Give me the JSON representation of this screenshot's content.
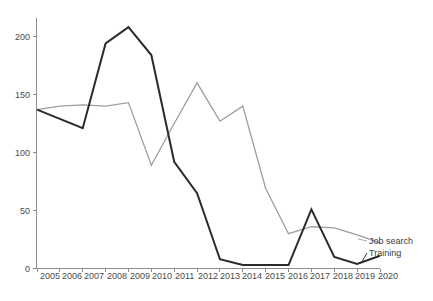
{
  "chart_data": {
    "type": "line",
    "title": "",
    "subtitle": "",
    "xlabel": "",
    "ylabel": "",
    "x": [
      2005,
      2006,
      2007,
      2008,
      2009,
      2010,
      2011,
      2012,
      2013,
      2014,
      2015,
      2016,
      2017,
      2018,
      2019,
      2020
    ],
    "categories": [
      "2005",
      "2006",
      "2007",
      "2008",
      "2009",
      "2010",
      "2011",
      "2012",
      "2013",
      "2014",
      "2015",
      "2016",
      "2017",
      "2018",
      "2019",
      "2020"
    ],
    "xtick_labels": [
      "2005",
      "2006",
      "2007",
      "2008",
      "2009",
      "2010",
      "2011",
      "2012",
      "2013",
      "2014",
      "2015",
      "2016",
      "2017",
      "2018",
      "2019",
      "2020"
    ],
    "ytick_labels": [
      "0",
      "50",
      "100",
      "150",
      "200"
    ],
    "yticks": [
      0,
      50,
      100,
      150,
      200
    ],
    "ylim": [
      0,
      215
    ],
    "xlim": [
      2005,
      2020
    ],
    "grid": false,
    "legend_position": "right-inline",
    "series": [
      {
        "name": "Job search",
        "color": "#9e9e9e",
        "label": "Job search",
        "values": [
          137,
          140,
          141,
          140,
          143,
          89,
          125,
          160,
          127,
          140,
          69,
          30,
          36,
          35,
          29,
          22
        ]
      },
      {
        "name": "Training",
        "color": "#2b2b2b",
        "label": "Training",
        "values": [
          137,
          129,
          121,
          194,
          208,
          184,
          92,
          65,
          8,
          3,
          3,
          3,
          51,
          10,
          4,
          11
        ]
      }
    ],
    "legend_entries": [
      {
        "label": "Job search",
        "color": "#9e9e9e"
      },
      {
        "label": "Training",
        "color": "#2b2b2b"
      }
    ]
  },
  "legend": {
    "job_search_label": "Job search",
    "training_label": "Training"
  },
  "axes": {
    "y_tick_0": "0",
    "y_tick_50": "50",
    "y_tick_100": "100",
    "y_tick_150": "150",
    "y_tick_200": "200",
    "x_tick_2005": "2005",
    "x_tick_2006": "2006",
    "x_tick_2007": "2007",
    "x_tick_2008": "2008",
    "x_tick_2009": "2009",
    "x_tick_2010": "2010",
    "x_tick_2011": "2011",
    "x_tick_2012": "2012",
    "x_tick_2013": "2013",
    "x_tick_2014": "2014",
    "x_tick_2015": "2015",
    "x_tick_2016": "2016",
    "x_tick_2017": "2017",
    "x_tick_2018": "2018",
    "x_tick_2019": "2019",
    "x_tick_2020": "2020"
  },
  "colors": {
    "job_search": "#9e9e9e",
    "training": "#2b2b2b",
    "axis": "#8c8c8c",
    "text": "#3a3a3a",
    "background": "#ffffff"
  }
}
